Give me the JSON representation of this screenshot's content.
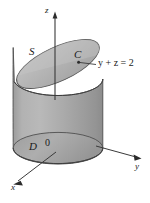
{
  "figure": {
    "background_color": "#ffffff",
    "labels": {
      "z_axis": "z",
      "y_axis": "y",
      "x_axis": "x",
      "origin": "0",
      "surface": "S",
      "curve": "C",
      "region": "D",
      "plane_equation": "y + z = 2",
      "plane_equation_parts": {
        "y": "y",
        "plus": "+",
        "z": "z",
        "equals": "=",
        "value": "2"
      }
    },
    "colors": {
      "cylinder_body": "#a9a9a9",
      "cylinder_body_light": "#bdbdbd",
      "cylinder_body_dark": "#8f8f8f",
      "top_surface": "#b6b6b6",
      "top_surface_edge": "#9a9a9a",
      "bottom_disk": "#a2a2a2",
      "outline": "#4a4a4a",
      "axis": "#3a3a3a",
      "label_text": "#1a1a1a"
    },
    "geometry": {
      "cylinder_left_x": 13,
      "cylinder_right_x": 103,
      "top_ellipse_center": [
        58,
        64
      ],
      "top_ellipse_rx": 45,
      "top_ellipse_ry": 17,
      "top_ellipse_rotation_deg": -25,
      "bottom_ellipse_center": [
        58,
        148
      ],
      "bottom_ellipse_rx": 45,
      "bottom_ellipse_ry": 16,
      "origin_point": [
        58,
        148
      ],
      "z_axis_tip": [
        55,
        12
      ],
      "y_axis_tip": [
        141,
        158
      ],
      "x_axis_tip": [
        13,
        184
      ]
    }
  }
}
